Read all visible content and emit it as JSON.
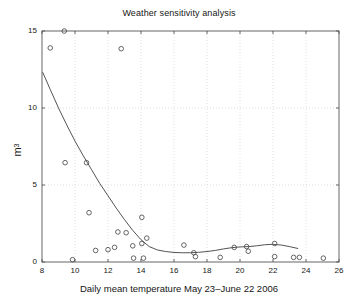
{
  "chart_data": {
    "type": "scatter",
    "title": "Weather sensitivity analysis",
    "xlabel": "Daily mean temperature May 23–June 22 2006",
    "ylabel_text": "m",
    "ylabel_sup": "3",
    "xlim": [
      8,
      26
    ],
    "ylim": [
      0,
      15
    ],
    "xticks": [
      8,
      10,
      12,
      14,
      16,
      18,
      20,
      22,
      24,
      26
    ],
    "yticks": [
      0,
      5,
      10,
      15
    ],
    "xtick_labels": [
      "8",
      "10",
      "12",
      "14",
      "16",
      "18",
      "20",
      "22",
      "24",
      "26"
    ],
    "ytick_labels": [
      "0",
      "5",
      "10",
      "15"
    ],
    "grid": true,
    "grid_style": "dotted",
    "legend": null,
    "marker": "open-circle",
    "marker_color": "#4a4a4a",
    "line_color": "#3f3f3f",
    "background_color": "#ffffff",
    "points": [
      {
        "x": 8.5,
        "y": 13.9
      },
      {
        "x": 9.35,
        "y": 15.0
      },
      {
        "x": 9.4,
        "y": 6.45
      },
      {
        "x": 9.85,
        "y": 0.15
      },
      {
        "x": 10.7,
        "y": 6.45
      },
      {
        "x": 10.85,
        "y": 3.2
      },
      {
        "x": 11.25,
        "y": 0.75
      },
      {
        "x": 12.0,
        "y": 0.8
      },
      {
        "x": 12.4,
        "y": 0.95
      },
      {
        "x": 12.6,
        "y": 1.95
      },
      {
        "x": 12.8,
        "y": 13.85
      },
      {
        "x": 13.1,
        "y": 1.9
      },
      {
        "x": 13.5,
        "y": 1.05
      },
      {
        "x": 13.55,
        "y": 0.25
      },
      {
        "x": 14.05,
        "y": 1.2
      },
      {
        "x": 14.05,
        "y": 2.9
      },
      {
        "x": 14.15,
        "y": 0.25
      },
      {
        "x": 14.35,
        "y": 1.55
      },
      {
        "x": 16.6,
        "y": 1.1
      },
      {
        "x": 17.2,
        "y": 0.6
      },
      {
        "x": 17.3,
        "y": 0.35
      },
      {
        "x": 18.8,
        "y": 0.3
      },
      {
        "x": 19.65,
        "y": 0.95
      },
      {
        "x": 20.4,
        "y": 1.0
      },
      {
        "x": 20.5,
        "y": 0.7
      },
      {
        "x": 22.1,
        "y": 1.2
      },
      {
        "x": 22.1,
        "y": 0.35
      },
      {
        "x": 23.25,
        "y": 0.3
      },
      {
        "x": 23.6,
        "y": 0.3
      },
      {
        "x": 25.05,
        "y": 0.25
      }
    ],
    "fit_curve": [
      {
        "x": 8.05,
        "y": 12.3
      },
      {
        "x": 8.5,
        "y": 11.2
      },
      {
        "x": 9.0,
        "y": 10.0
      },
      {
        "x": 9.5,
        "y": 8.9
      },
      {
        "x": 10.0,
        "y": 7.85
      },
      {
        "x": 10.5,
        "y": 6.9
      },
      {
        "x": 11.0,
        "y": 6.0
      },
      {
        "x": 11.5,
        "y": 5.1
      },
      {
        "x": 12.0,
        "y": 4.3
      },
      {
        "x": 12.5,
        "y": 3.5
      },
      {
        "x": 13.0,
        "y": 2.75
      },
      {
        "x": 13.5,
        "y": 2.05
      },
      {
        "x": 14.0,
        "y": 1.45
      },
      {
        "x": 14.5,
        "y": 1.0
      },
      {
        "x": 15.0,
        "y": 0.78
      },
      {
        "x": 15.5,
        "y": 0.68
      },
      {
        "x": 16.0,
        "y": 0.62
      },
      {
        "x": 16.5,
        "y": 0.6
      },
      {
        "x": 17.0,
        "y": 0.6
      },
      {
        "x": 17.5,
        "y": 0.63
      },
      {
        "x": 18.0,
        "y": 0.68
      },
      {
        "x": 18.5,
        "y": 0.75
      },
      {
        "x": 19.0,
        "y": 0.85
      },
      {
        "x": 19.5,
        "y": 0.93
      },
      {
        "x": 20.0,
        "y": 0.98
      },
      {
        "x": 20.5,
        "y": 1.0
      },
      {
        "x": 21.0,
        "y": 1.05
      },
      {
        "x": 21.5,
        "y": 1.12
      },
      {
        "x": 22.0,
        "y": 1.15
      },
      {
        "x": 22.5,
        "y": 1.1
      },
      {
        "x": 23.0,
        "y": 1.0
      },
      {
        "x": 23.5,
        "y": 0.88
      }
    ]
  }
}
